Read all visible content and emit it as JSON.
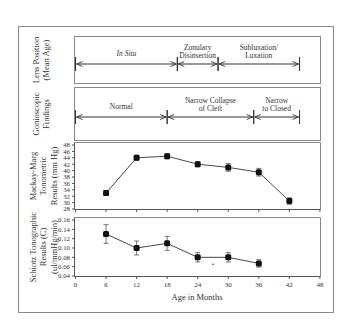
{
  "chart_data": [
    {
      "type": "timeline",
      "panel": "Lens Position (Mean Age)",
      "ylabel_lines": [
        "Lens Position",
        "(Mean Age)"
      ],
      "segments": [
        {
          "label_lines": [
            "In Situ"
          ],
          "italic": true,
          "start_month": 0,
          "end_month": 20
        },
        {
          "label_lines": [
            "Zonulary",
            "Disinsertion"
          ],
          "start_month": 20,
          "end_month": 28
        },
        {
          "label_lines": [
            "Subluxation/",
            "Luxation"
          ],
          "start_month": 28,
          "end_month": 44
        }
      ]
    },
    {
      "type": "timeline",
      "panel": "Gonioscopic Findings",
      "ylabel_lines": [
        "Gonioscopic",
        "Findings"
      ],
      "segments": [
        {
          "label_lines": [
            "Normal"
          ],
          "start_month": 0,
          "end_month": 18
        },
        {
          "label_lines": [
            "Narrow Collapse",
            "of Cleft"
          ],
          "start_month": 18,
          "end_month": 35
        },
        {
          "label_lines": [
            "Narrow",
            "to Closed"
          ],
          "start_month": 35,
          "end_month": 44
        }
      ]
    },
    {
      "type": "line",
      "panel": "Mackay-Marg Tonometric Results (mm Hg)",
      "ylabel_lines": [
        "Mackay-Marg",
        "Tonometric",
        "Results (mm Hg)"
      ],
      "x": [
        6,
        12,
        18,
        24,
        30,
        36,
        42
      ],
      "values": [
        33,
        44,
        44.5,
        42,
        41,
        39.5,
        30.5
      ],
      "errors": [
        0.8,
        0.8,
        0.8,
        0.8,
        1.2,
        1.2,
        1.0
      ],
      "ylim": [
        28,
        48
      ],
      "yticks": [
        "48",
        "46",
        "44",
        "42",
        "40",
        "38",
        "36",
        "34",
        "32",
        "30",
        "28"
      ]
    },
    {
      "type": "line",
      "panel": "Schiotz Tonographic Results (C) (ul/mmHg/min)",
      "ylabel_lines": [
        "Schiotz Tonographic",
        "Results (C)",
        "(ul/mmHg/min)"
      ],
      "x": [
        6,
        12,
        18,
        24,
        30,
        36
      ],
      "values": [
        0.13,
        0.1,
        0.11,
        0.08,
        0.08,
        0.067
      ],
      "errors": [
        0.02,
        0.015,
        0.015,
        0.01,
        0.01,
        0.008
      ],
      "ylim": [
        0.04,
        0.16
      ],
      "yticks": [
        "0.16",
        "0.14",
        "0.12",
        "0.10",
        "0.08",
        "0.06",
        "0.04"
      ],
      "annotation": {
        "x": 27,
        "y": 0.065,
        "text": "*"
      }
    }
  ],
  "xaxis": {
    "label": "Age in Months",
    "ticks": [
      "0",
      "6",
      "12",
      "18",
      "24",
      "30",
      "36",
      "42",
      "48"
    ],
    "range": [
      0,
      48
    ]
  }
}
